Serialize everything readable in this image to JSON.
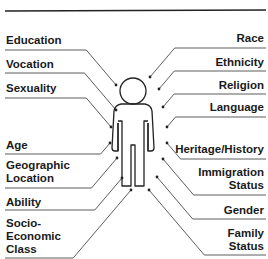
{
  "diagram": {
    "title_rule": true,
    "figure": "person-outline",
    "colors": {
      "line": "#222222",
      "text": "#1a1a1a",
      "background": "#ffffff"
    },
    "left_labels": [
      {
        "text": "Education",
        "top": 34,
        "line_y": 50,
        "dot": [
          116,
          85
        ]
      },
      {
        "text": "Vocation",
        "top": 58,
        "line_y": 73,
        "dot": [
          116,
          110
        ]
      },
      {
        "text": "Sexuality",
        "top": 82,
        "line_y": 98,
        "dot": [
          111,
          127
        ]
      },
      {
        "text": "Age",
        "top": 139,
        "line_y": 154,
        "dot": [
          110,
          143
        ]
      },
      {
        "text": "Geographic\nLocation",
        "top": 159,
        "line_y": 188,
        "dot": [
          117,
          158
        ]
      },
      {
        "text": "Ability",
        "top": 196,
        "line_y": 210,
        "dot": [
          122,
          178
        ]
      },
      {
        "text": "Socio-\nEconomic\nClass",
        "top": 217,
        "line_y": 258,
        "dot": [
          131,
          190
        ]
      }
    ],
    "right_labels": [
      {
        "text": "Race",
        "top": 32,
        "line_y": 48,
        "dot": [
          150,
          77
        ]
      },
      {
        "text": "Ethnicity",
        "top": 56,
        "line_y": 71,
        "dot": [
          159,
          89
        ]
      },
      {
        "text": "Religion",
        "top": 79,
        "line_y": 94,
        "dot": [
          163,
          107
        ]
      },
      {
        "text": "Language",
        "top": 101,
        "line_y": 117,
        "dot": [
          167,
          127
        ]
      },
      {
        "text": "Heritage/History",
        "top": 143,
        "line_y": 159,
        "dot": [
          167,
          143
        ]
      },
      {
        "text": "Immigration\nStatus",
        "top": 166,
        "line_y": 195,
        "dot": [
          163,
          159
        ]
      },
      {
        "text": "Gender",
        "top": 204,
        "line_y": 219,
        "dot": [
          157,
          177
        ]
      },
      {
        "text": "Family\nStatus",
        "top": 227,
        "line_y": 255,
        "dot": [
          149,
          190
        ]
      }
    ]
  }
}
